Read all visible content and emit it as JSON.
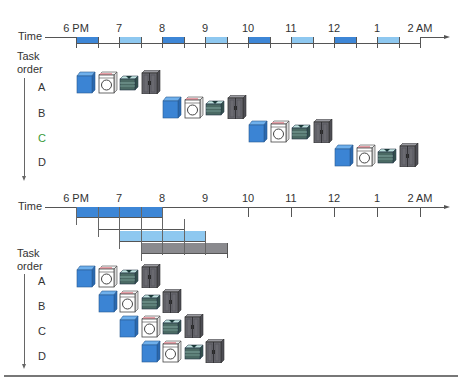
{
  "top": {
    "axis_label": "Time",
    "hours": [
      "6 PM",
      "7",
      "8",
      "9",
      "10",
      "11",
      "12",
      "1",
      "2 AM"
    ],
    "task_order_label_line1": "Task",
    "task_order_label_line2": "order",
    "tasks": [
      {
        "label": "A",
        "color": "#333333"
      },
      {
        "label": "B",
        "color": "#333333"
      },
      {
        "label": "C",
        "color": "#3a9a3a"
      },
      {
        "label": "D",
        "color": "#333333"
      }
    ],
    "segment_colors": [
      "#3d86d6",
      "#ffffff",
      "#8ec8f0",
      "#ffffff"
    ]
  },
  "bottom": {
    "axis_label": "Time",
    "hours": [
      "6 PM",
      "7",
      "8",
      "9",
      "10",
      "11",
      "12",
      "1",
      "2 AM"
    ],
    "task_order_label_line1": "Task",
    "task_order_label_line2": "order",
    "tasks": [
      {
        "label": "A"
      },
      {
        "label": "B"
      },
      {
        "label": "C"
      },
      {
        "label": "D"
      }
    ],
    "gantt_rows": [
      {
        "stage": "wash",
        "start_half_hours": 0,
        "end_half_hours": 4,
        "color": "#3d86d6"
      },
      {
        "stage": "dry",
        "start_half_hours": 1,
        "end_half_hours": 5,
        "color": "#ffffff"
      },
      {
        "stage": "fold",
        "start_half_hours": 2,
        "end_half_hours": 6,
        "color": "#8ec8f0"
      },
      {
        "stage": "store",
        "start_half_hours": 3,
        "end_half_hours": 7,
        "color": "#8a8a8e"
      }
    ]
  },
  "icons": {
    "stages": [
      "washer-icon",
      "dryer-icon",
      "folding-table-icon",
      "closet-icon"
    ],
    "colors": {
      "washer": "#3b84d4",
      "dryer": "#ffffff",
      "folding": "#4b6a64",
      "closet": "#6a6a70"
    }
  }
}
